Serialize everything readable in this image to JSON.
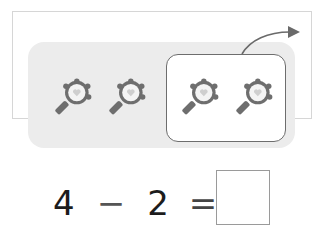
{
  "exercise": {
    "description": "Subtraction picture exercise with hand mirrors",
    "item_icon": "hand-mirror-icon",
    "total_items": 4,
    "removed_items": 2,
    "removal_indicator": "curved-arrow-icon"
  },
  "equation": {
    "minuend": "4",
    "operator": "−",
    "subtrahend": "2",
    "equals": "=",
    "answer": ""
  },
  "colors": {
    "panel": "#ececec",
    "group_border": "#6d6d6d",
    "mirror_frame": "#6e6e6e",
    "mirror_glass": "#f4f4f4",
    "text": "#1c1c1c"
  }
}
